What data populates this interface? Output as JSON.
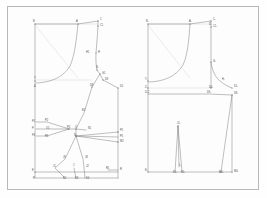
{
  "document": {
    "kind": "pattern-draft",
    "title": "Bodice block pattern draft",
    "panels": [
      "front-block",
      "back-block"
    ],
    "frame_color": "#b9b9b9",
    "line_color": "#6f6f6f",
    "construction_line_color": "#c2c2c2",
    "background_color": "#fdfdfd",
    "label_color": "#4a4a4a"
  },
  "left_panel": {
    "name": "front-block",
    "points": [
      {
        "id": "B",
        "x": 35,
        "y": 24,
        "lx": 33,
        "ly": 22
      },
      {
        "id": "A",
        "x": 78,
        "y": 24,
        "lx": 76,
        "ly": 22
      },
      {
        "id": "C",
        "x": 98,
        "y": 21,
        "lx": 100,
        "ly": 20
      },
      {
        "id": "C1",
        "x": 98,
        "y": 26,
        "lx": 100,
        "ly": 26
      },
      {
        "id": "H1",
        "x": 91,
        "y": 53,
        "lx": 86,
        "ly": 53
      },
      {
        "id": "H",
        "x": 96,
        "y": 53,
        "lx": 98,
        "ly": 53
      },
      {
        "id": "G",
        "x": 97,
        "y": 70,
        "lx": 96,
        "ly": 68
      },
      {
        "id": "G1",
        "x": 100,
        "y": 74,
        "lx": 102,
        "ly": 74
      },
      {
        "id": "D9",
        "x": 103,
        "y": 80,
        "lx": 105,
        "ly": 80
      },
      {
        "id": "D8",
        "x": 92,
        "y": 87,
        "lx": 90,
        "ly": 86
      },
      {
        "id": "D1",
        "x": 118,
        "y": 88,
        "lx": 120,
        "ly": 87
      },
      {
        "id": "Y",
        "x": 36,
        "y": 81,
        "lx": 34,
        "ly": 79
      },
      {
        "id": "Z",
        "x": 36,
        "y": 86,
        "lx": 34,
        "ly": 87
      },
      {
        "id": "E2",
        "x": 84,
        "y": 113,
        "lx": 82,
        "ly": 111
      },
      {
        "id": "F1",
        "x": 36,
        "y": 122,
        "lx": 32,
        "ly": 122
      },
      {
        "id": "P2",
        "x": 47,
        "y": 122,
        "lx": 45,
        "ly": 121
      },
      {
        "id": "F",
        "x": 36,
        "y": 129,
        "lx": 32,
        "ly": 129
      },
      {
        "id": "O1",
        "x": 48,
        "y": 129,
        "lx": 46,
        "ly": 129
      },
      {
        "id": "F3",
        "x": 36,
        "y": 136,
        "lx": 32,
        "ly": 136
      },
      {
        "id": "P6",
        "x": 47,
        "y": 136,
        "lx": 45,
        "ly": 137
      },
      {
        "id": "P4",
        "x": 69,
        "y": 129,
        "lx": 67,
        "ly": 128
      },
      {
        "id": "O",
        "x": 76,
        "y": 129,
        "lx": 75,
        "ly": 128
      },
      {
        "id": "N1",
        "x": 86,
        "y": 130,
        "lx": 88,
        "ly": 129
      },
      {
        "id": "N",
        "x": 76,
        "y": 136,
        "lx": 74,
        "ly": 136
      },
      {
        "id": "P1",
        "x": 118,
        "y": 132,
        "lx": 120,
        "ly": 131
      },
      {
        "id": "P5",
        "x": 118,
        "y": 137,
        "lx": 120,
        "ly": 137
      },
      {
        "id": "M2",
        "x": 118,
        "y": 142,
        "lx": 120,
        "ly": 142
      },
      {
        "id": "J9",
        "x": 65,
        "y": 159,
        "lx": 63,
        "ly": 158
      },
      {
        "id": "J8",
        "x": 83,
        "y": 159,
        "lx": 85,
        "ly": 158
      },
      {
        "id": "J1",
        "x": 55,
        "y": 168,
        "lx": 53,
        "ly": 167
      },
      {
        "id": "J",
        "x": 74,
        "y": 168,
        "lx": 73,
        "ly": 166
      },
      {
        "id": "J2",
        "x": 84,
        "y": 168,
        "lx": 86,
        "ly": 167
      },
      {
        "id": "K2",
        "x": 65,
        "y": 178,
        "lx": 63,
        "ly": 179
      },
      {
        "id": "K3",
        "x": 76,
        "y": 178,
        "lx": 75,
        "ly": 179
      },
      {
        "id": "K4",
        "x": 85,
        "y": 178,
        "lx": 86,
        "ly": 179
      },
      {
        "id": "R1",
        "x": 108,
        "y": 170,
        "lx": 106,
        "ly": 169
      },
      {
        "id": "R",
        "x": 118,
        "y": 170,
        "lx": 120,
        "ly": 170
      },
      {
        "id": "E",
        "x": 36,
        "y": 172,
        "lx": 32,
        "ly": 171
      },
      {
        "id": "P",
        "x": 36,
        "y": 178,
        "lx": 33,
        "ly": 179
      }
    ]
  },
  "right_panel": {
    "name": "back-block",
    "points": [
      {
        "id": "B-",
        "x": 148,
        "y": 24,
        "lx": 146,
        "ly": 22
      },
      {
        "id": "A-",
        "x": 190,
        "y": 24,
        "lx": 189,
        "ly": 22
      },
      {
        "id": "C-",
        "x": 211,
        "y": 21,
        "lx": 213,
        "ly": 20
      },
      {
        "id": "C1-",
        "x": 211,
        "y": 27,
        "lx": 213,
        "ly": 27
      },
      {
        "id": "D-",
        "x": 211,
        "y": 26,
        "lx": 209,
        "ly": 25
      },
      {
        "id": "G-",
        "x": 211,
        "y": 62,
        "lx": 213,
        "ly": 62
      },
      {
        "id": "H-",
        "x": 220,
        "y": 81,
        "lx": 222,
        "ly": 80
      },
      {
        "id": "Y-",
        "x": 148,
        "y": 81,
        "lx": 145,
        "ly": 80
      },
      {
        "id": "Z-",
        "x": 148,
        "y": 87,
        "lx": 145,
        "ly": 88
      },
      {
        "id": "D0-",
        "x": 211,
        "y": 88,
        "lx": 209,
        "ly": 88
      },
      {
        "id": "D1-",
        "x": 232,
        "y": 88,
        "lx": 234,
        "ly": 87
      },
      {
        "id": "D-2",
        "x": 148,
        "y": 94,
        "lx": 145,
        "ly": 93
      },
      {
        "id": "D9-",
        "x": 209,
        "y": 94,
        "lx": 207,
        "ly": 93
      },
      {
        "id": "D8-",
        "x": 232,
        "y": 95,
        "lx": 234,
        "ly": 94
      },
      {
        "id": "J1-",
        "x": 178,
        "y": 126,
        "lx": 177,
        "ly": 124
      },
      {
        "id": "K1-",
        "x": 175,
        "y": 172,
        "lx": 173,
        "ly": 173
      },
      {
        "id": "K5-",
        "x": 182,
        "y": 172,
        "lx": 181,
        "ly": 173
      },
      {
        "id": "L-",
        "x": 179,
        "y": 167,
        "lx": 179,
        "ly": 166
      },
      {
        "id": "M1-",
        "x": 221,
        "y": 172,
        "lx": 219,
        "ly": 173
      },
      {
        "id": "M0-",
        "x": 232,
        "y": 172,
        "lx": 234,
        "ly": 172
      },
      {
        "id": "E-",
        "x": 148,
        "y": 172,
        "lx": 145,
        "ly": 171
      }
    ]
  }
}
